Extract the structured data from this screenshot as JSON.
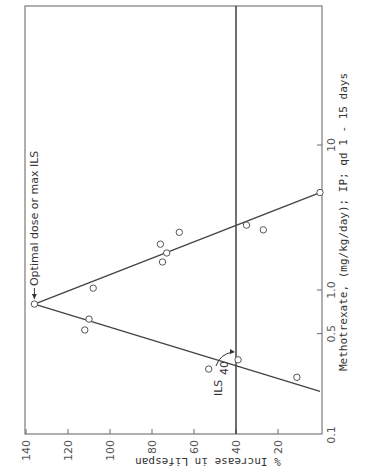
{
  "chart_data": {
    "type": "scatter",
    "orientation": "rotated-90-clockwise",
    "title": "",
    "xlabel": "Methotrexate, (mg/kg/day); IP; qd 1 - 15 days",
    "ylabel": "% Increase in Lifespan",
    "x_scale": "log",
    "xlim": [
      0.1,
      100
    ],
    "ylim": [
      0,
      140
    ],
    "x_ticks": [
      {
        "value": 0.1,
        "label": "0.1"
      },
      {
        "value": 0.5,
        "label": "0.5"
      },
      {
        "value": 1.0,
        "label": "1.0"
      },
      {
        "value": 10,
        "label": "10"
      }
    ],
    "y_ticks": [
      {
        "value": 20,
        "label": "20"
      },
      {
        "value": 40,
        "label": "40"
      },
      {
        "value": 60,
        "label": "60"
      },
      {
        "value": 80,
        "label": "80"
      },
      {
        "value": 100,
        "label": "100"
      },
      {
        "value": 120,
        "label": "120"
      },
      {
        "value": 140,
        "label": "140"
      }
    ],
    "grid": false,
    "legend": "none",
    "points": [
      {
        "x": 0.8,
        "y": 136
      },
      {
        "x": 1.03,
        "y": 108
      },
      {
        "x": 0.63,
        "y": 110
      },
      {
        "x": 0.53,
        "y": 112
      },
      {
        "x": 2.5,
        "y": 67
      },
      {
        "x": 2.07,
        "y": 76
      },
      {
        "x": 1.8,
        "y": 73
      },
      {
        "x": 1.56,
        "y": 75
      },
      {
        "x": 2.8,
        "y": 35
      },
      {
        "x": 2.6,
        "y": 27
      },
      {
        "x": 4.7,
        "y": 0
      },
      {
        "x": 0.33,
        "y": 39
      },
      {
        "x": 0.285,
        "y": 53
      },
      {
        "x": 0.25,
        "y": 11
      }
    ],
    "fit_lines": [
      {
        "name": "ascending",
        "from": {
          "x": 0.2,
          "y": 0
        },
        "to": {
          "x": 0.8,
          "y": 136
        }
      },
      {
        "name": "descending",
        "from": {
          "x": 0.8,
          "y": 136
        },
        "to": {
          "x": 4.7,
          "y": 0
        }
      }
    ],
    "reference_line": {
      "y": 40,
      "label": "ILS",
      "subscript": "40"
    },
    "annotations": [
      {
        "text": "Optimal dose or max ILS",
        "target": {
          "x": 0.8,
          "y": 136
        }
      }
    ],
    "corner_label": "0.1"
  }
}
